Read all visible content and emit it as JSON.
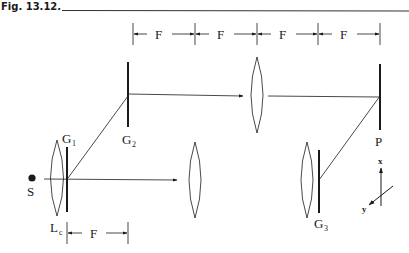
{
  "figure": {
    "title": "Fig. 13.12.",
    "dimension_label": "F",
    "top_dimensions": [
      "F",
      "F",
      "F",
      "F"
    ],
    "bottom_dimension": "F",
    "components": {
      "source": {
        "label": "S"
      },
      "collimator_lens": {
        "label": "L",
        "subscript": "c"
      },
      "grating_1": {
        "label": "G",
        "subscript": "1"
      },
      "grating_2": {
        "label": "G",
        "subscript": "2"
      },
      "grating_3": {
        "label": "G",
        "subscript": "3"
      },
      "plane": {
        "label": "P"
      }
    },
    "axes": {
      "x_label": "x",
      "y_label": "y"
    },
    "colors": {
      "stroke": "#1a1a1a",
      "background": "#ffffff"
    }
  }
}
